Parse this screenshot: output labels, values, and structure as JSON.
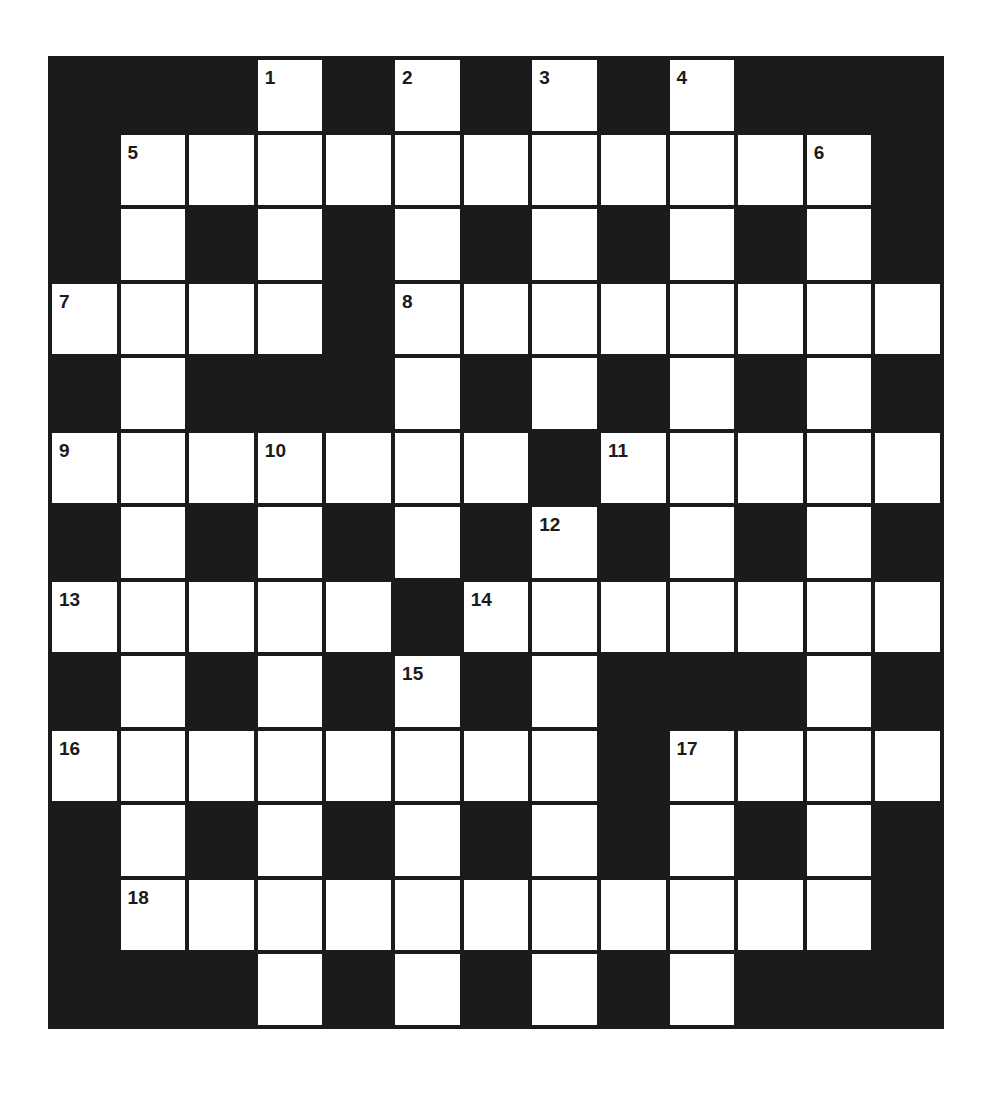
{
  "puzzle": {
    "rows": 13,
    "cols": 13,
    "colors": {
      "block": "#1b1b1b",
      "cell": "#ffffff",
      "number": "#1b1b1b",
      "background": "#ffffff"
    },
    "layout": [
      "###.#.#.#.###",
      "#...........#",
      "#.#.#.#.#.#.#",
      "....#........",
      "#.###.#.#.#.#",
      ".......#.....",
      "#.#.#.#.#.#.#",
      ".....#.......",
      "#.#.#.#.###.#",
      "........#....",
      "#.#.#.#.#.#.#",
      "#...........#",
      "###.#.#.#.###"
    ],
    "numbers": [
      {
        "row": 0,
        "col": 3,
        "label": "1"
      },
      {
        "row": 0,
        "col": 5,
        "label": "2"
      },
      {
        "row": 0,
        "col": 7,
        "label": "3"
      },
      {
        "row": 0,
        "col": 9,
        "label": "4"
      },
      {
        "row": 1,
        "col": 1,
        "label": "5"
      },
      {
        "row": 1,
        "col": 11,
        "label": "6"
      },
      {
        "row": 3,
        "col": 0,
        "label": "7"
      },
      {
        "row": 3,
        "col": 5,
        "label": "8"
      },
      {
        "row": 5,
        "col": 0,
        "label": "9"
      },
      {
        "row": 5,
        "col": 3,
        "label": "10"
      },
      {
        "row": 5,
        "col": 8,
        "label": "11"
      },
      {
        "row": 6,
        "col": 7,
        "label": "12"
      },
      {
        "row": 7,
        "col": 0,
        "label": "13"
      },
      {
        "row": 7,
        "col": 6,
        "label": "14"
      },
      {
        "row": 8,
        "col": 5,
        "label": "15"
      },
      {
        "row": 9,
        "col": 0,
        "label": "16"
      },
      {
        "row": 9,
        "col": 9,
        "label": "17"
      },
      {
        "row": 11,
        "col": 1,
        "label": "18"
      }
    ],
    "entries": [],
    "clues": {
      "across": [
        "5",
        "7",
        "8",
        "9",
        "11",
        "13",
        "14",
        "16",
        "17",
        "18"
      ],
      "down": [
        "1",
        "2",
        "3",
        "4",
        "5",
        "6",
        "10",
        "12",
        "15"
      ]
    }
  }
}
